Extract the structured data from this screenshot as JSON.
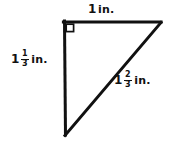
{
  "figure": {
    "name": "right-triangle-with-dimensions",
    "shape": "right triangle",
    "background_color": "#ffffff",
    "stroke_color": "#111111",
    "right_angle_marker": {
      "present": true,
      "vertex": "top-left"
    },
    "vertices": {
      "top_left": [
        64,
        22
      ],
      "top_right": [
        161,
        22
      ],
      "bottom_left": [
        65,
        135
      ]
    }
  },
  "labels": {
    "top": {
      "whole": "1",
      "fraction": null,
      "unit": "in.",
      "full_text": "1 in.",
      "side": "top leg"
    },
    "left": {
      "whole": "1",
      "fraction": {
        "numerator": "1",
        "denominator": "3"
      },
      "unit": "in.",
      "full_text": "1 1/3 in.",
      "side": "left leg"
    },
    "hypotenuse": {
      "whole": "1",
      "fraction": {
        "numerator": "2",
        "denominator": "3"
      },
      "unit": "in.",
      "full_text": "1 2/3 in.",
      "side": "hypotenuse"
    }
  }
}
